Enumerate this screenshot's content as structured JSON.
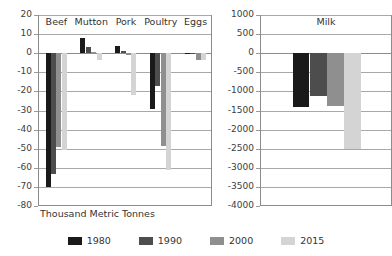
{
  "chart_data": {
    "type": "bar",
    "title": "",
    "orientation": "vertical",
    "grouped": true,
    "grid": true,
    "legend_position": "bottom",
    "series_colors": [
      "#1a1a1a",
      "#4d4d4d",
      "#8f8f8f",
      "#d4d4d4"
    ],
    "legend": [
      {
        "name": "1980",
        "color": "#1a1a1a"
      },
      {
        "name": "1990",
        "color": "#4d4d4d"
      },
      {
        "name": "2000",
        "color": "#8f8f8f"
      },
      {
        "name": "2015",
        "color": "#d4d4d4"
      }
    ],
    "panels": [
      {
        "id": "meat-panel",
        "panel_label": "",
        "xlabel": "Thousand Metric Tonnes",
        "ylabel": "",
        "ylim": [
          -80,
          20
        ],
        "ytick_step": 10,
        "yticks": [
          "20",
          "10",
          "0",
          "-10",
          "-20",
          "-30",
          "-40",
          "-50",
          "-60",
          "-70",
          "-80"
        ],
        "categories": [
          "Beef",
          "Mutton",
          "Pork",
          "Poultry",
          "Eggs"
        ],
        "series": [
          {
            "name": "1980",
            "values": [
              -70,
              8,
              4,
              -29,
              -0.5
            ]
          },
          {
            "name": "1990",
            "values": [
              -63,
              3.5,
              1,
              -17,
              -0.5
            ]
          },
          {
            "name": "2000",
            "values": [
              -49,
              0.5,
              -1,
              -48.5,
              -3.5
            ]
          },
          {
            "name": "2015",
            "values": [
              -50.5,
              -3.5,
              -22,
              -61,
              -3.5
            ]
          }
        ]
      },
      {
        "id": "milk-panel",
        "panel_label": "Milk",
        "xlabel": "",
        "ylabel": "",
        "ylim": [
          -4000,
          1000
        ],
        "ytick_step": 500,
        "yticks": [
          "1000",
          "500",
          "0",
          "-500",
          "-1000",
          "-1500",
          "-2000",
          "-2500",
          "-3000",
          "-3500",
          "-4000"
        ],
        "categories": [
          "Milk"
        ],
        "series": [
          {
            "name": "1980",
            "values": [
              -1400
            ]
          },
          {
            "name": "1990",
            "values": [
              -1130
            ]
          },
          {
            "name": "2000",
            "values": [
              -1380
            ]
          },
          {
            "name": "2015",
            "values": [
              -2500
            ]
          }
        ]
      }
    ]
  }
}
